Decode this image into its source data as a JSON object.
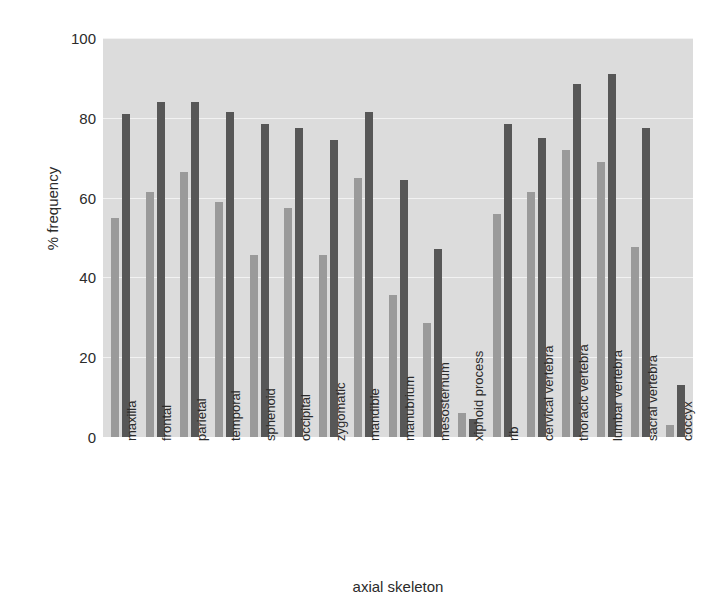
{
  "chart_data": {
    "type": "bar",
    "title": "",
    "xlabel": "axial skeleton",
    "ylabel": "% frequency",
    "ylim": [
      0,
      100
    ],
    "ytick_values": [
      0,
      20,
      40,
      60,
      80,
      100
    ],
    "ytick_labels": [
      "0",
      "20",
      "40",
      "60",
      "80",
      "100"
    ],
    "grid": true,
    "legend": "none",
    "categories": [
      "maxilla",
      "frontal",
      "parietal",
      "temporal",
      "sphenoid",
      "occipital",
      "zygomatic",
      "mandible",
      "manubrium",
      "mesosternum",
      "xiphoid process",
      "rib",
      "cervical vertebra",
      "thoracic vertebra",
      "lumbar vertebra",
      "sacral vertebra",
      "coccyx"
    ],
    "series": [
      {
        "name": "series-1",
        "color": "#9a9a9a",
        "values": [
          55,
          61.5,
          66.5,
          59,
          45.5,
          57.5,
          45.5,
          65,
          35.5,
          28.5,
          6,
          56,
          61.5,
          72,
          69,
          47.5,
          3
        ]
      },
      {
        "name": "series-2",
        "color": "#575757",
        "values": [
          81,
          84,
          84,
          81.5,
          78.5,
          77.5,
          74.5,
          81.5,
          64.5,
          47,
          4.5,
          78.5,
          75,
          88.5,
          91,
          77.5,
          13
        ]
      }
    ]
  },
  "axes": {
    "y_title": "% frequency",
    "x_title": "axial skeleton"
  }
}
